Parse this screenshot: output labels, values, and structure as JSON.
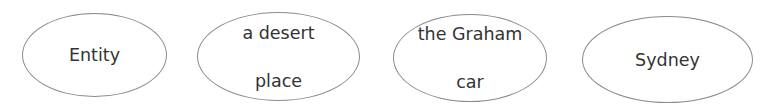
{
  "diagram": {
    "type": "node-set",
    "node_shape": "ellipse",
    "stroke_color": "#8a8a8a",
    "text_color": "#333333",
    "nodes": [
      {
        "id": "n1",
        "label": "Entity",
        "lines": [
          "Entity"
        ]
      },
      {
        "id": "n2",
        "label": "a desert place",
        "lines": [
          "a desert",
          "place"
        ]
      },
      {
        "id": "n3",
        "label": "the Graham car",
        "lines": [
          "the Graham",
          "car"
        ]
      },
      {
        "id": "n4",
        "label": "Sydney",
        "lines": [
          "Sydney"
        ]
      }
    ],
    "edges": []
  }
}
